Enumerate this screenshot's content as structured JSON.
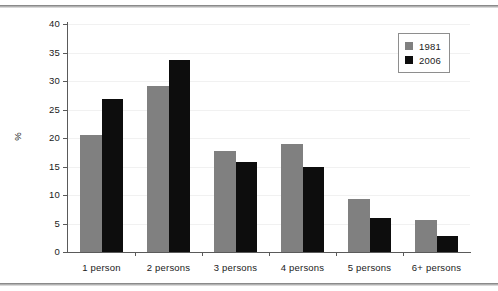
{
  "chart_data": {
    "type": "bar",
    "title": "",
    "subtitle": "",
    "xlabel": "",
    "ylabel": "%",
    "ylim": [
      0,
      40
    ],
    "yticks": [
      0,
      5,
      10,
      15,
      20,
      25,
      30,
      35,
      40
    ],
    "ytick_labels": [
      "0",
      "5",
      "10",
      "15",
      "20",
      "25",
      "30",
      "35",
      "40"
    ],
    "grid": true,
    "grid_axis": "y",
    "legend_position": "top-right",
    "categories": [
      "1 person",
      "2 persons",
      "3 persons",
      "4 persons",
      "5 persons",
      "6+ persons"
    ],
    "series": [
      {
        "name": "1981",
        "color": "#808080",
        "values": [
          20.5,
          29.1,
          17.8,
          18.9,
          9.3,
          5.6
        ]
      },
      {
        "name": "2006",
        "color": "#0d0d0d",
        "values": [
          26.8,
          33.6,
          15.8,
          15.0,
          5.9,
          2.8
        ]
      }
    ]
  },
  "legend": {
    "items": [
      {
        "label": "1981",
        "color": "#808080"
      },
      {
        "label": "2006",
        "color": "#0d0d0d"
      }
    ]
  },
  "axis": {
    "y_title": "%"
  }
}
